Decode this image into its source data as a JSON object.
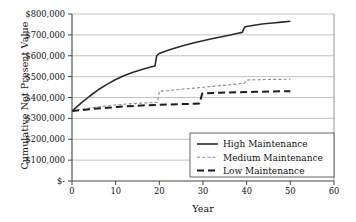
{
  "chart_data": {
    "type": "line",
    "title": "",
    "xlabel": "Year",
    "ylabel": "Cumulative Net Present Value",
    "xlim": [
      0,
      60
    ],
    "ylim": [
      0,
      800000
    ],
    "grid": true,
    "grid_axis": "y",
    "legend_position": "lower-right",
    "xticks": [
      0,
      10,
      20,
      30,
      40,
      50,
      60
    ],
    "xticklabels": [
      "0",
      "10",
      "20",
      "30",
      "40",
      "50",
      "60"
    ],
    "yticks": [
      0,
      100000,
      200000,
      300000,
      400000,
      500000,
      600000,
      700000,
      800000
    ],
    "yticklabels": [
      "$-",
      "$100,000",
      "$200,000",
      "$300,000",
      "$400,000",
      "$500,000",
      "$600,000",
      "$700,000",
      "$800,000"
    ],
    "series": [
      {
        "name": "High Maintenance",
        "style": "solid",
        "color": "#2b2b2b",
        "width": 1.6,
        "x": [
          0,
          2,
          4,
          6,
          8,
          10,
          12,
          14,
          16,
          18,
          19,
          19.4,
          20,
          22,
          24,
          26,
          28,
          30,
          32,
          34,
          36,
          38,
          39,
          39.5,
          40,
          42,
          44,
          46,
          48,
          50
        ],
        "y": [
          335000,
          372000,
          406000,
          437000,
          463000,
          486000,
          505000,
          521000,
          534000,
          546000,
          551000,
          600000,
          611000,
          626000,
          639000,
          651000,
          662000,
          672000,
          681000,
          690000,
          698000,
          708000,
          712000,
          736000,
          740000,
          747000,
          753000,
          757000,
          761000,
          765000
        ]
      },
      {
        "name": "Medium Maintenance",
        "style": "dashed-fine",
        "color": "#8c8c8c",
        "width": 1.1,
        "x": [
          0,
          2,
          4,
          6,
          8,
          10,
          12,
          14,
          16,
          18,
          19.6,
          20,
          22,
          24,
          26,
          28,
          30,
          32,
          34,
          36,
          38,
          39.4,
          40,
          42,
          44,
          46,
          48,
          50
        ],
        "y": [
          335000,
          342000,
          349000,
          355000,
          360000,
          364000,
          368000,
          371000,
          373000,
          375000,
          377000,
          430000,
          433000,
          437000,
          441000,
          445000,
          449000,
          453000,
          457000,
          461000,
          465000,
          468000,
          484000,
          485000,
          486000,
          487000,
          487000,
          488000
        ]
      },
      {
        "name": "Low Maintenance",
        "style": "dashed-long",
        "color": "#1c1c1c",
        "width": 2.0,
        "x": [
          0,
          4,
          8,
          12,
          16,
          20,
          24,
          28,
          29.2,
          29.8,
          30,
          34,
          38,
          42,
          46,
          50
        ],
        "y": [
          335000,
          344000,
          351000,
          357000,
          362000,
          365000,
          368000,
          370000,
          371000,
          418000,
          420000,
          423000,
          425000,
          427000,
          429000,
          430000
        ]
      }
    ]
  },
  "legend": {
    "entries": [
      {
        "label": "High Maintenance"
      },
      {
        "label": "Medium Maintenance"
      },
      {
        "label": "Low Maintenance"
      }
    ]
  }
}
